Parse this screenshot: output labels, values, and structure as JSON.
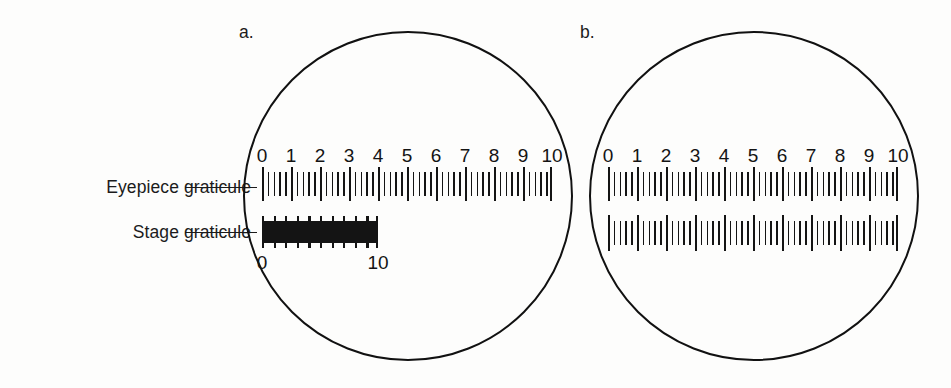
{
  "figure": {
    "labels": {
      "eyepiece": "Eyepiece graticule",
      "stage": "Stage graticule"
    },
    "panels": [
      {
        "letter": "a.",
        "eyepiece_scale": [
          "0",
          "1",
          "2",
          "3",
          "4",
          "5",
          "6",
          "7",
          "8",
          "9",
          "10"
        ],
        "stage_scale": [
          "0",
          "10"
        ],
        "stage_span_eyepiece_units": 4
      },
      {
        "letter": "b.",
        "eyepiece_scale": [
          "0",
          "1",
          "2",
          "3",
          "4",
          "5",
          "6",
          "7",
          "8",
          "9",
          "10"
        ],
        "stage_scale": [],
        "stage_span_eyepiece_units": 10
      }
    ]
  },
  "chart_data": {
    "type": "diagram",
    "panels": [
      {
        "label": "a.",
        "eyepiece_graticule": {
          "ticks_labeled": [
            "0",
            "1",
            "2",
            "3",
            "4",
            "5",
            "6",
            "7",
            "8",
            "9",
            "10"
          ],
          "major_divisions": 10,
          "minor_per_major": 5,
          "span_units": 10
        },
        "stage_graticule": {
          "ticks_labeled": [
            "0",
            "10"
          ],
          "major_divisions": 10,
          "minor_per_major": 5,
          "aligned_eyepiece_start": 0,
          "aligned_eyepiece_end": 4,
          "note": "10 stage divisions align with 4 eyepiece divisions"
        }
      },
      {
        "label": "b.",
        "eyepiece_graticule": {
          "ticks_labeled": [
            "0",
            "1",
            "2",
            "3",
            "4",
            "5",
            "6",
            "7",
            "8",
            "9",
            "10"
          ],
          "major_divisions": 10,
          "minor_per_major": 5,
          "span_units": 10
        },
        "stage_graticule": {
          "ticks_labeled": [],
          "major_divisions": 10,
          "minor_per_major": 5,
          "aligned_eyepiece_start": 0,
          "aligned_eyepiece_end": 10,
          "note": "10 stage divisions align with 10 eyepiece divisions"
        }
      }
    ],
    "colors": {
      "ink": "#141414",
      "background": "#fdfdfc"
    }
  }
}
